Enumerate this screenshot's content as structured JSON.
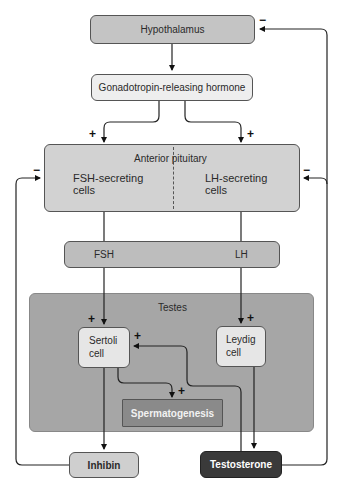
{
  "diagram": {
    "nodes": {
      "hypothalamus": "Hypothalamus",
      "gnrh": "Gonadotropin-releasing hormone",
      "anterior_pituitary": "Anterior pituitary",
      "fsh_cells_line1": "FSH-secreting",
      "fsh_cells_line2": "cells",
      "lh_cells_line1": "LH-secreting",
      "lh_cells_line2": "cells",
      "fsh": "FSH",
      "lh": "LH",
      "testes": "Testes",
      "sertoli_line1": "Sertoli",
      "sertoli_line2": "cell",
      "leydig_line1": "Leydig",
      "leydig_line2": "cell",
      "spermatogenesis": "Spermatogenesis",
      "inhibin": "Inhibin",
      "testosterone": "Testosterone"
    },
    "signs": {
      "plus": "+",
      "minus": "−"
    },
    "edges": [
      {
        "from": "Hypothalamus",
        "to": "Gonadotropin-releasing hormone",
        "sign": ""
      },
      {
        "from": "Gonadotropin-releasing hormone",
        "to": "FSH-secreting cells",
        "sign": "+"
      },
      {
        "from": "Gonadotropin-releasing hormone",
        "to": "LH-secreting cells",
        "sign": "+"
      },
      {
        "from": "FSH",
        "to": "Sertoli cell",
        "sign": "+"
      },
      {
        "from": "LH",
        "to": "Leydig cell",
        "sign": "+"
      },
      {
        "from": "Sertoli cell",
        "to": "Spermatogenesis",
        "sign": "+"
      },
      {
        "from": "Testosterone",
        "to": "Sertoli cell",
        "sign": "+"
      },
      {
        "from": "Sertoli cell",
        "to": "Inhibin",
        "sign": ""
      },
      {
        "from": "Leydig cell",
        "to": "Testosterone",
        "sign": ""
      },
      {
        "from": "Inhibin",
        "to": "Anterior pituitary",
        "sign": "-"
      },
      {
        "from": "Testosterone",
        "to": "Anterior pituitary",
        "sign": "-"
      },
      {
        "from": "Testosterone",
        "to": "Hypothalamus",
        "sign": "-"
      }
    ],
    "colors": {
      "hypothalamus": "#c4c4c4",
      "gnrh": "#eeeeee",
      "pituitary": "#d2d2d2",
      "fsh_lh_bar": "#bdbdbd",
      "testes": "#a6a6a6",
      "cells": "#e6e6e6",
      "spermatogenesis": "#8a8a8a",
      "inhibin": "#cfcfcf",
      "testosterone": "#3a3a3a"
    }
  }
}
